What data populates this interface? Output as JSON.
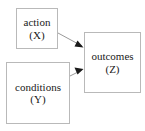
{
  "diagram": {
    "background_color": "#ffffff",
    "box_border_color": "#b9b9b9",
    "edge_color": "#9a9a9a",
    "arrowhead_color": "#1a1a1a",
    "text_color": "#1a1a1a",
    "nodes": [
      {
        "id": "action",
        "label": "action",
        "variable": "(X)",
        "x": 16,
        "y": 8,
        "width": 42,
        "height": 41
      },
      {
        "id": "conditions",
        "label": "conditions",
        "variable": "(Y)",
        "x": 6,
        "y": 62,
        "width": 64,
        "height": 62
      },
      {
        "id": "outcomes",
        "label": "outcomes",
        "variable": "(Z)",
        "x": 84,
        "y": 32,
        "width": 57,
        "height": 61
      }
    ],
    "edges": [
      {
        "id": "action-to-outcomes",
        "from": "action",
        "to": "outcomes",
        "from_point": [
          58,
          33
        ],
        "to_point": [
          84,
          47
        ]
      },
      {
        "id": "conditions-to-outcomes",
        "from": "conditions",
        "to": "outcomes",
        "from_point": [
          70,
          76
        ],
        "to_point": [
          84,
          70
        ]
      }
    ]
  }
}
